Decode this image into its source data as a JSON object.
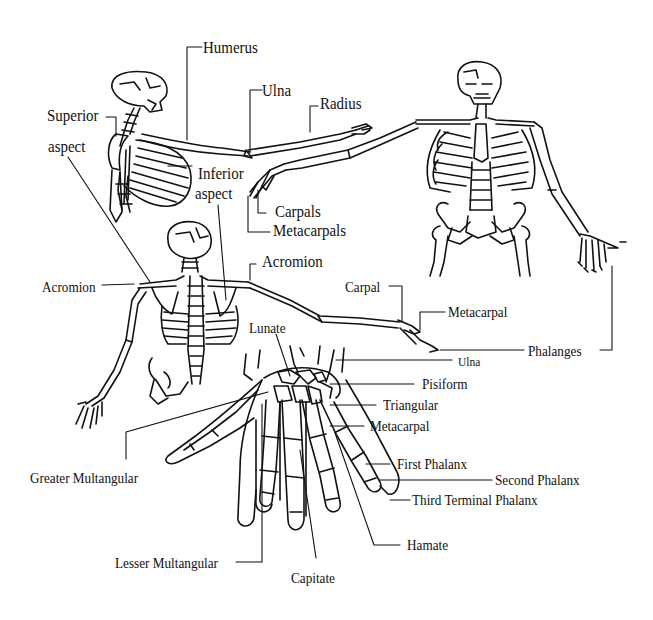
{
  "figure": {
    "colors": {
      "ink": "#111111",
      "background": "#ffffff"
    }
  },
  "labels": {
    "humerus": "Humerus",
    "ulna_top": "Ulna",
    "radius": "Radius",
    "superior": "Superior",
    "aspect_superior": "aspect",
    "inferior": "Inferior",
    "aspect_inferior": "aspect",
    "carpals": "Carpals",
    "metacarpals": "Metacarpals",
    "acromion_left": "Acromion",
    "acromion_right": "Acromion",
    "carpal": "Carpal",
    "metacarpal_arm": "Metacarpal",
    "phalanges": "Phalanges",
    "lunate": "Lunate",
    "ulna_hand": "Ulna",
    "pisiform": "Pisiform",
    "triangular": "Triangular",
    "metacarpal_hand": "Metacarpal",
    "first_phalanx": "First Phalanx",
    "second_phalanx": "Second Phalanx",
    "third_terminal_phalanx": "Third Terminal Phalanx",
    "greater_multangular": "Greater Multangular",
    "lesser_multangular": "Lesser Multangular",
    "capitate": "Capitate",
    "hamate": "Hamate"
  },
  "figures": [
    {
      "name": "side-view-skeleton",
      "description": "Upper body side view with arm extended"
    },
    {
      "name": "front-view-skeleton",
      "description": "Full front skeleton with arms outstretched"
    },
    {
      "name": "back-view-skeleton",
      "description": "Upper back view showing scapulae and acromion"
    },
    {
      "name": "hand-skeleton",
      "description": "Bones of the hand and wrist"
    }
  ]
}
